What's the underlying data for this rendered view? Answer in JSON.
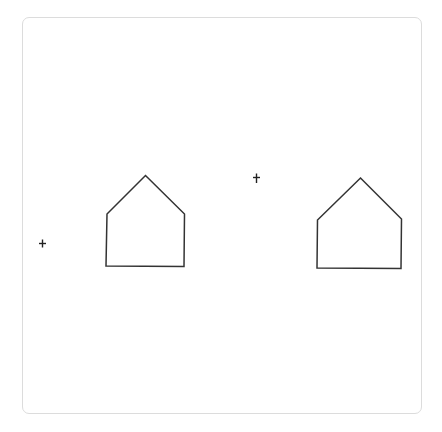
{
  "canvas": {
    "width": 442,
    "height": 432,
    "background": "#ffffff",
    "frame": {
      "x": 22,
      "y": 17,
      "width": 400,
      "height": 397,
      "border_color": "#dcdcdc",
      "radius": 7
    },
    "stroke_color": "#333333"
  },
  "shapes": [
    {
      "name": "house-left",
      "type": "pentagon-house",
      "points": [
        [
          145.5,
          175.5
        ],
        [
          184.5,
          214
        ],
        [
          184,
          266.5
        ],
        [
          106,
          266
        ],
        [
          107,
          214
        ]
      ]
    },
    {
      "name": "house-right",
      "type": "pentagon-house",
      "points": [
        [
          360.5,
          178
        ],
        [
          401.5,
          219
        ],
        [
          401,
          268.5
        ],
        [
          317,
          268
        ],
        [
          317.5,
          220
        ]
      ]
    }
  ],
  "markers": [
    {
      "name": "cross-left",
      "type": "plus",
      "x": 42.5,
      "y": 243.5,
      "h_half": 3.5,
      "v_top": 4,
      "v_bottom": 4
    },
    {
      "name": "cross-center",
      "type": "dagger",
      "x": 256.5,
      "y": 177.5,
      "h_half": 3.5,
      "v_top": 4,
      "v_bottom": 5.5
    }
  ]
}
